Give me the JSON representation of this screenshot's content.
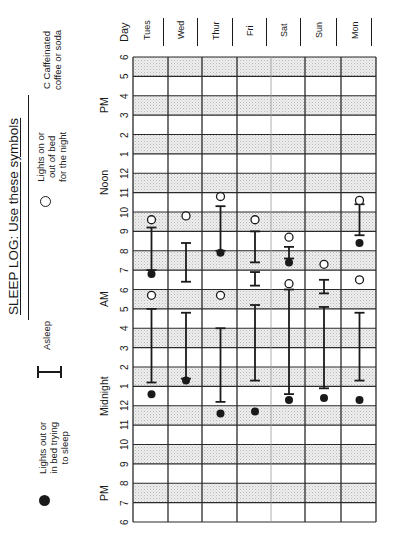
{
  "title": "SLEEP LOG:  Use these symbols",
  "legend": [
    {
      "symbol": "filled-circle",
      "label_lines": [
        "Lights out or",
        "in bed trying",
        "to sleep"
      ]
    },
    {
      "symbol": "bar",
      "label_lines": [
        "Asleep"
      ]
    },
    {
      "symbol": "open-circle",
      "label_lines": [
        "Lights on or",
        "out of bed",
        "for the night"
      ]
    },
    {
      "symbol": "C",
      "label_lines": [
        "C  Caffeinated",
        "coffee or soda"
      ]
    }
  ],
  "axis": {
    "day_header": "Day",
    "tick_labels": [
      "6",
      "7",
      "8",
      "9",
      "10",
      "11",
      "12",
      "1",
      "2",
      "3",
      "4",
      "5",
      "6",
      "7",
      "8",
      "9",
      "10",
      "11",
      "12",
      "1",
      "2",
      "3",
      "4",
      "5",
      "6"
    ],
    "period_labels": [
      {
        "text": "PM",
        "at": 1.5
      },
      {
        "text": "Midnight",
        "at": 6.5
      },
      {
        "text": "AM",
        "at": 11.5
      },
      {
        "text": "Noon",
        "at": 17.5
      },
      {
        "text": "PM",
        "at": 21.5
      }
    ]
  },
  "colors": {
    "ink": "#1a1a1a",
    "shade": "#e6e6e6",
    "grid": "#2a2a2a"
  },
  "chart_data": {
    "type": "table",
    "title": "SLEEP LOG",
    "xlabel": "Time of day (6 PM to 6 PM)",
    "ylabel": "Day",
    "hour_scale_note": "Values are hours elapsed since 6 PM (0 = 6 PM, 6 = Midnight, 12 = 6 AM, 18 = Noon, 24 = 6 PM)",
    "xlim": [
      0,
      24
    ],
    "categories": [
      "Tues",
      "Wed",
      "Thur",
      "Fri",
      "Sat",
      "Sun",
      "Mon"
    ],
    "days": [
      {
        "day": "Tues",
        "lights_out": [
          6.6,
          12.8
        ],
        "asleep": [
          [
            7.2,
            11.0
          ],
          [
            13.0,
            15.2
          ]
        ],
        "lights_on": [
          11.7,
          15.6
        ]
      },
      {
        "day": "Wed",
        "lights_out": [
          7.3
        ],
        "asleep": [
          [
            7.4,
            10.8
          ],
          [
            12.4,
            14.4
          ]
        ],
        "lights_on": [
          15.8
        ]
      },
      {
        "day": "Thur",
        "lights_out": [
          5.6,
          13.9
        ],
        "asleep": [
          [
            6.2,
            10.0
          ],
          [
            14.0,
            16.3
          ]
        ],
        "lights_on": [
          11.7,
          16.8
        ]
      },
      {
        "day": "Fri",
        "lights_out": [
          5.7
        ],
        "asleep": [
          [
            7.3,
            11.2
          ],
          [
            12.2,
            12.9
          ],
          [
            13.4,
            15.0
          ]
        ],
        "lights_on": [
          15.6
        ]
      },
      {
        "day": "Sat",
        "lights_out": [
          6.3,
          13.4
        ],
        "asleep": [
          [
            6.6,
            12.0
          ],
          [
            13.6,
            14.2
          ]
        ],
        "lights_on": [
          12.3,
          14.7
        ]
      },
      {
        "day": "Sun",
        "lights_out": [
          6.4
        ],
        "asleep": [
          [
            6.9,
            11.1
          ],
          [
            11.8,
            12.5
          ]
        ],
        "lights_on": [
          13.3
        ]
      },
      {
        "day": "Mon",
        "lights_out": [
          6.3,
          14.4
        ],
        "asleep": [
          [
            7.3,
            10.8
          ],
          [
            14.8,
            16.4
          ]
        ],
        "lights_on": [
          12.5,
          16.6
        ]
      }
    ],
    "legend": [
      "Lights out or in bed trying to sleep",
      "Asleep",
      "Lights on or out of bed for the night",
      "C Caffeinated coffee or soda"
    ],
    "grid": true
  }
}
